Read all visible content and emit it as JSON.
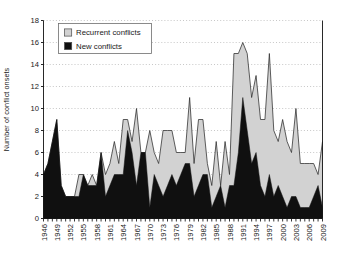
{
  "chart_data": {
    "type": "area",
    "stacked": true,
    "title": "",
    "xlabel": "",
    "ylabel": "Number of conflict onsets",
    "ylim": [
      0,
      18
    ],
    "ytick_step": 2,
    "yticks": [
      0,
      2,
      4,
      6,
      8,
      10,
      12,
      14,
      16,
      18
    ],
    "grid": "horizontal-dotted",
    "legend_position": "top-left",
    "xlim": [
      1946,
      2009
    ],
    "xtick_step": 3,
    "xticks": [
      1946,
      1949,
      1952,
      1955,
      1958,
      1961,
      1964,
      1967,
      1970,
      1973,
      1976,
      1979,
      1982,
      1985,
      1988,
      1991,
      1994,
      1997,
      2000,
      2003,
      2006,
      2009
    ],
    "x": [
      1946,
      1947,
      1948,
      1949,
      1950,
      1951,
      1952,
      1953,
      1954,
      1955,
      1956,
      1957,
      1958,
      1959,
      1960,
      1961,
      1962,
      1963,
      1964,
      1965,
      1966,
      1967,
      1968,
      1969,
      1970,
      1971,
      1972,
      1973,
      1974,
      1975,
      1976,
      1977,
      1978,
      1979,
      1980,
      1981,
      1982,
      1983,
      1984,
      1985,
      1986,
      1987,
      1988,
      1989,
      1990,
      1991,
      1992,
      1993,
      1994,
      1995,
      1996,
      1997,
      1998,
      1999,
      2000,
      2001,
      2002,
      2003,
      2004,
      2005,
      2006,
      2007,
      2008,
      2009
    ],
    "series": [
      {
        "name": "New conflicts",
        "color": "#101010",
        "values": [
          4,
          5,
          7,
          9,
          3,
          2,
          2,
          2,
          2,
          4,
          3,
          3,
          3,
          6,
          2,
          3,
          4,
          4,
          4,
          8,
          6,
          3,
          6,
          6,
          1,
          4,
          3,
          2,
          3,
          4,
          3,
          4,
          5,
          5,
          2,
          3,
          4,
          4,
          1,
          2,
          3,
          1,
          3,
          3,
          6,
          11,
          8,
          5,
          6,
          3,
          2,
          4,
          2,
          3,
          2,
          1,
          2,
          2,
          1,
          1,
          1,
          2,
          3,
          1
        ]
      },
      {
        "name": "Recurrent conflicts",
        "color": "#d2d2d2",
        "values": [
          0,
          0,
          0,
          0,
          0,
          0,
          0,
          0,
          2,
          0,
          0,
          1,
          0,
          0,
          2,
          2,
          3,
          1,
          5,
          1,
          1,
          7,
          0,
          0,
          7,
          2,
          2,
          6,
          5,
          4,
          3,
          2,
          1,
          6,
          3,
          6,
          5,
          1,
          2,
          5,
          0,
          6,
          1,
          12,
          9,
          5,
          7,
          6,
          7,
          6,
          7,
          11,
          6,
          4,
          7,
          6,
          4,
          8,
          4,
          4,
          4,
          3,
          1,
          6
        ]
      }
    ],
    "totals": [
      4,
      5,
      7,
      9,
      3,
      2,
      2,
      2,
      4,
      4,
      3,
      4,
      3,
      6,
      4,
      5,
      7,
      5,
      9,
      9,
      7,
      10,
      6,
      6,
      8,
      6,
      5,
      8,
      8,
      8,
      6,
      6,
      6,
      11,
      5,
      9,
      9,
      5,
      3,
      7,
      3,
      7,
      4,
      15,
      15,
      16,
      15,
      11,
      13,
      9,
      9,
      15,
      8,
      7,
      9,
      7,
      6,
      10,
      5,
      5,
      5,
      5,
      4,
      7
    ]
  },
  "legend": {
    "items": [
      {
        "label": "Recurrent conflicts",
        "swatch": "#d2d2d2"
      },
      {
        "label": "New conflicts",
        "swatch": "#101010"
      }
    ]
  },
  "axes": {
    "y_label": "Number of conflict onsets"
  }
}
